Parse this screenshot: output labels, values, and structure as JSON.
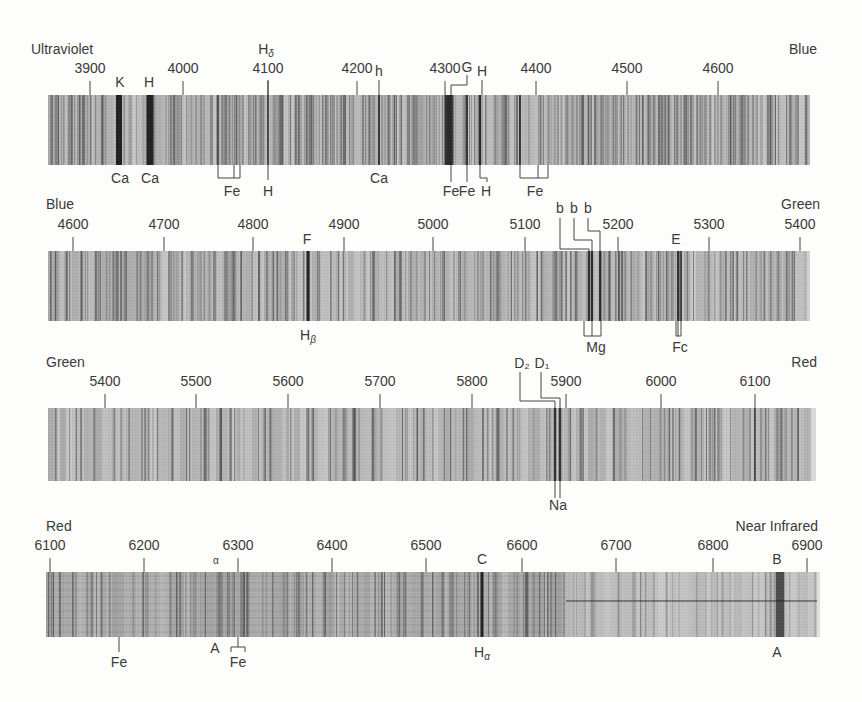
{
  "colors": {
    "background": "#fdfdfb",
    "band_base": "#b4b4b4",
    "band_light": "#c8c8c8",
    "line_dark": "#2a2a2a",
    "text": "#3a3a3a"
  },
  "bands": [
    {
      "id": "band-1",
      "region_left": "Ultraviolet",
      "region_right": "Blue",
      "wl_start": 3870,
      "wl_end": 4680,
      "x0": 48,
      "x1": 810,
      "y0": 95,
      "y1": 165,
      "ticks": [
        {
          "wl": 3900,
          "x": 90,
          "label": "3900"
        },
        {
          "wl": 4000,
          "x": 183,
          "label": "4000"
        },
        {
          "wl": 4100,
          "x": 268,
          "label": "4100"
        },
        {
          "wl": 4200,
          "x": 357,
          "label": "4200"
        },
        {
          "wl": 4300,
          "x": 445,
          "label": "4300"
        },
        {
          "wl": 4400,
          "x": 536,
          "label": "4400"
        },
        {
          "wl": 4500,
          "x": 627,
          "label": "4500"
        },
        {
          "wl": 4600,
          "x": 718,
          "label": "4600"
        }
      ],
      "labels_top": [
        {
          "text": "K",
          "x": 120,
          "y": 87
        },
        {
          "text": "H",
          "x": 149,
          "y": 87
        },
        {
          "text": "Hδ",
          "x": 266,
          "y": 54
        },
        {
          "text": "h",
          "x": 379,
          "y": 76
        },
        {
          "text": "G",
          "x": 467,
          "y": 72
        },
        {
          "text": "H",
          "x": 482,
          "y": 76
        }
      ],
      "labels_bottom": [
        {
          "text": "Ca",
          "x": 120,
          "y": 183
        },
        {
          "text": "Ca",
          "x": 150,
          "y": 183
        },
        {
          "text": "Fe",
          "x": 232,
          "y": 196
        },
        {
          "text": "H",
          "x": 268,
          "y": 196
        },
        {
          "text": "Ca",
          "x": 379,
          "y": 183
        },
        {
          "text": "Fe",
          "x": 451,
          "y": 196
        },
        {
          "text": "Fe",
          "x": 467,
          "y": 196
        },
        {
          "text": "H",
          "x": 486,
          "y": 196
        },
        {
          "text": "Fe",
          "x": 535,
          "y": 196
        }
      ],
      "strong_lines": [
        {
          "x": 119,
          "w": 6,
          "shade": 0.95
        },
        {
          "x": 150,
          "w": 7,
          "shade": 0.95
        },
        {
          "x": 218,
          "w": 1.5,
          "shade": 0.8
        },
        {
          "x": 268,
          "w": 2,
          "shade": 0.7
        },
        {
          "x": 379,
          "w": 2,
          "shade": 0.8
        },
        {
          "x": 449,
          "w": 9,
          "shade": 0.85
        },
        {
          "x": 467,
          "w": 2,
          "shade": 0.8
        },
        {
          "x": 480,
          "w": 2.5,
          "shade": 0.85
        },
        {
          "x": 520,
          "w": 2,
          "shade": 0.8
        }
      ]
    },
    {
      "id": "band-2",
      "region_left": "Blue",
      "region_right": "Green",
      "wl_start": 4580,
      "wl_end": 5400,
      "x0": 48,
      "x1": 807,
      "y0": 251,
      "y1": 321,
      "ticks": [
        {
          "wl": 4600,
          "x": 73,
          "label": "4600"
        },
        {
          "wl": 4700,
          "x": 164,
          "label": "4700"
        },
        {
          "wl": 4800,
          "x": 253,
          "label": "4800"
        },
        {
          "wl": 4900,
          "x": 344,
          "label": "4900"
        },
        {
          "wl": 5000,
          "x": 433,
          "label": "5000"
        },
        {
          "wl": 5100,
          "x": 525,
          "label": "5100"
        },
        {
          "wl": 5200,
          "x": 618,
          "label": "5200"
        },
        {
          "wl": 5300,
          "x": 709,
          "label": "5300"
        },
        {
          "wl": 5400,
          "x": 800,
          "label": "5400"
        }
      ],
      "labels_top": [
        {
          "text": "F",
          "x": 307,
          "y": 244
        },
        {
          "text": "b",
          "x": 560,
          "y": 213
        },
        {
          "text": "b",
          "x": 574,
          "y": 213
        },
        {
          "text": "b",
          "x": 588,
          "y": 213
        },
        {
          "text": "E",
          "x": 676,
          "y": 244
        }
      ],
      "labels_bottom": [
        {
          "text": "Hβ",
          "x": 308,
          "y": 340
        },
        {
          "text": "Mg",
          "x": 596,
          "y": 352
        },
        {
          "text": "Fc",
          "x": 680,
          "y": 352
        }
      ],
      "strong_lines": [
        {
          "x": 308,
          "w": 3,
          "shade": 0.95
        },
        {
          "x": 589,
          "w": 2,
          "shade": 0.85
        },
        {
          "x": 592,
          "w": 2,
          "shade": 0.85
        },
        {
          "x": 600,
          "w": 2,
          "shade": 0.85
        },
        {
          "x": 678,
          "w": 2,
          "shade": 0.75
        },
        {
          "x": 681,
          "w": 2,
          "shade": 0.75
        }
      ]
    },
    {
      "id": "band-3",
      "region_left": "Green",
      "region_right": "Red",
      "wl_start": 5340,
      "wl_end": 6160,
      "x0": 48,
      "x1": 811,
      "y0": 408,
      "y1": 481,
      "ticks": [
        {
          "wl": 5400,
          "x": 105,
          "label": "5400"
        },
        {
          "wl": 5500,
          "x": 196,
          "label": "5500"
        },
        {
          "wl": 5600,
          "x": 288,
          "label": "5600"
        },
        {
          "wl": 5700,
          "x": 380,
          "label": "5700"
        },
        {
          "wl": 5800,
          "x": 472,
          "label": "5800"
        },
        {
          "wl": 5900,
          "x": 566,
          "label": "5900"
        },
        {
          "wl": 6000,
          "x": 661,
          "label": "6000"
        },
        {
          "wl": 6100,
          "x": 755,
          "label": "6100"
        }
      ],
      "labels_top": [
        {
          "text": "D₂",
          "x": 522,
          "y": 368
        },
        {
          "text": "D₁",
          "x": 542,
          "y": 368
        }
      ],
      "labels_bottom": [
        {
          "text": "Na",
          "x": 558,
          "y": 510
        }
      ],
      "strong_lines": [
        {
          "x": 555,
          "w": 2.5,
          "shade": 0.95
        },
        {
          "x": 560,
          "w": 2.5,
          "shade": 0.95
        },
        {
          "x": 755,
          "w": 1.5,
          "shade": 0.6
        }
      ]
    },
    {
      "id": "band-4",
      "region_left": "Red",
      "region_right": "Near Infrared",
      "wl_start": 6090,
      "wl_end": 6930,
      "x0": 46,
      "x1": 817,
      "y0": 572,
      "y1": 637,
      "ticks": [
        {
          "wl": 6100,
          "x": 50,
          "label": "6100"
        },
        {
          "wl": 6200,
          "x": 144,
          "label": "6200"
        },
        {
          "wl": 6300,
          "x": 238,
          "label": "6300"
        },
        {
          "wl": 6400,
          "x": 332,
          "label": "6400"
        },
        {
          "wl": 6500,
          "x": 426,
          "label": "6500"
        },
        {
          "wl": 6600,
          "x": 522,
          "label": "6600"
        },
        {
          "wl": 6700,
          "x": 616,
          "label": "6700"
        },
        {
          "wl": 6800,
          "x": 713,
          "label": "6800"
        },
        {
          "wl": 6900,
          "x": 807,
          "label": "6900"
        }
      ],
      "labels_top": [
        {
          "text": "α",
          "x": 216,
          "y": 564
        },
        {
          "text": "C",
          "x": 482,
          "y": 564
        },
        {
          "text": "B",
          "x": 777,
          "y": 564
        }
      ],
      "labels_bottom": [
        {
          "text": "Fe",
          "x": 119,
          "y": 667
        },
        {
          "text": "A",
          "x": 215,
          "y": 653
        },
        {
          "text": "Fe",
          "x": 238,
          "y": 667
        },
        {
          "text": "Hα",
          "x": 482,
          "y": 657
        },
        {
          "text": "A",
          "x": 777,
          "y": 657
        }
      ],
      "strong_lines": [
        {
          "x": 482,
          "w": 3,
          "shade": 0.95
        },
        {
          "x": 780,
          "w": 8,
          "shade": 0.7
        }
      ]
    }
  ]
}
